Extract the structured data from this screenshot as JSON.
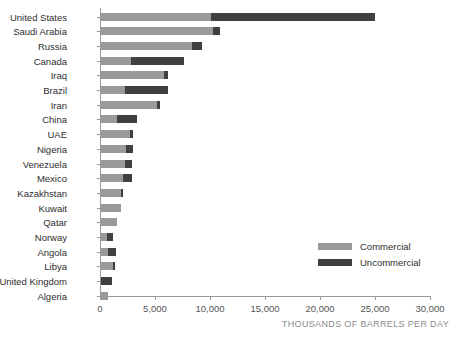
{
  "chart_data": {
    "type": "bar",
    "orientation": "horizontal",
    "stacked": true,
    "title": "",
    "subtitle": "",
    "xlabel": "THOUSANDS OF BARRELS PER DAY",
    "ylabel": "",
    "xlim": [
      0,
      30000
    ],
    "x_ticks": [
      0,
      5000,
      10000,
      15000,
      20000,
      25000,
      30000
    ],
    "x_tick_labels": [
      "0",
      "5,000",
      "10,000",
      "15,000",
      "20,000",
      "25,000",
      "30,000"
    ],
    "grid": false,
    "legend_position": "inside-right",
    "categories": [
      "United States",
      "Saudi Arabia",
      "Russia",
      "Canada",
      "Iraq",
      "Brazil",
      "Iran",
      "China",
      "UAE",
      "Nigeria",
      "Venezuela",
      "Mexico",
      "Kazakhstan",
      "Kuwait",
      "Qatar",
      "Norway",
      "Angola",
      "Libya",
      "United Kingdom",
      "Algeria"
    ],
    "series": [
      {
        "name": "Commercial",
        "color": "#9a9a9a",
        "values": [
          10100,
          10300,
          8400,
          2800,
          5800,
          2300,
          5200,
          1500,
          2700,
          2400,
          2300,
          2100,
          1900,
          1900,
          1500,
          600,
          700,
          1200,
          100,
          700
        ]
      },
      {
        "name": "Uncommercial",
        "color": "#404040",
        "values": [
          14900,
          600,
          900,
          4800,
          400,
          3900,
          300,
          1900,
          300,
          600,
          600,
          800,
          200,
          0,
          0,
          600,
          800,
          200,
          1000,
          0
        ]
      }
    ],
    "totals": [
      25000,
      10900,
      9300,
      7600,
      6200,
      6200,
      5500,
      3400,
      3000,
      3000,
      2900,
      2900,
      2100,
      1900,
      1500,
      1200,
      1500,
      1400,
      1100,
      700
    ]
  },
  "legend": {
    "items": [
      {
        "label": "Commercial",
        "color": "#9a9a9a",
        "swatch_name": "legend-swatch-commercial"
      },
      {
        "label": "Uncommercial",
        "color": "#404040",
        "swatch_name": "legend-swatch-uncommercial"
      }
    ]
  },
  "axis": {
    "caption": "THOUSANDS OF BARRELS PER DAY"
  },
  "colors": {
    "commercial": "#9a9a9a",
    "uncommercial": "#404040",
    "axis": "#9a9a9a",
    "label_text": "#2e2e2e",
    "tick_text": "#555555",
    "caption_text": "#8c8c8c",
    "background": "#ffffff"
  }
}
